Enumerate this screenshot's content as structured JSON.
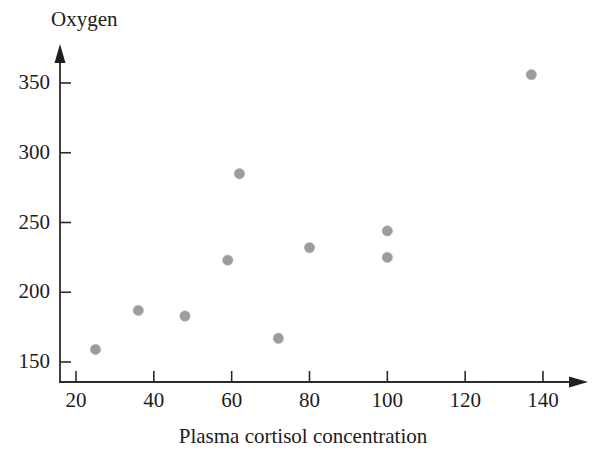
{
  "chart_data": {
    "type": "scatter",
    "title": "",
    "xlabel": "Plasma cortisol concentration",
    "ylabel": "Oxygen",
    "xlim": [
      14,
      152
    ],
    "ylim": [
      144,
      372
    ],
    "grid": false,
    "legend": null,
    "marker_color": "#9c9c9c",
    "axis_color": "#2b2b2b",
    "xticks": [
      20,
      40,
      60,
      80,
      100,
      120,
      140
    ],
    "xtick_labels": [
      "20",
      "40",
      "60",
      "80",
      "100",
      "120",
      "140"
    ],
    "yticks": [
      150,
      200,
      250,
      300,
      350
    ],
    "ytick_labels": [
      "150",
      "200",
      "250",
      "300",
      "350"
    ],
    "points": [
      {
        "x": 25,
        "y": 159
      },
      {
        "x": 36,
        "y": 187
      },
      {
        "x": 48,
        "y": 183
      },
      {
        "x": 59,
        "y": 223
      },
      {
        "x": 62,
        "y": 285
      },
      {
        "x": 72,
        "y": 167
      },
      {
        "x": 80,
        "y": 232
      },
      {
        "x": 100,
        "y": 244
      },
      {
        "x": 100,
        "y": 225
      },
      {
        "x": 137,
        "y": 356
      }
    ]
  },
  "axes": {
    "y_title": "Oxygen",
    "x_title": "Plasma cortisol concentration"
  }
}
